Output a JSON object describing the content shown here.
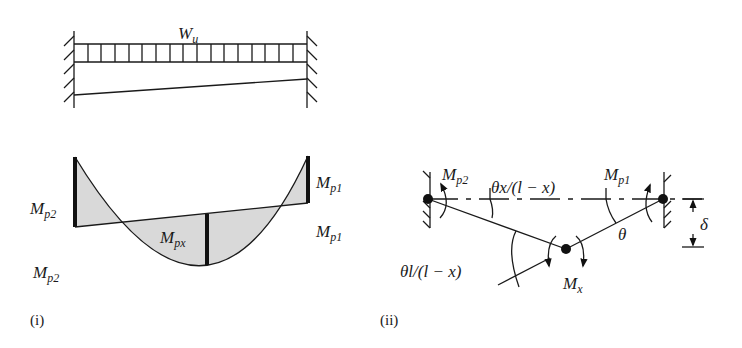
{
  "diagram": {
    "beam": {
      "load_label": "W",
      "load_sub": "u"
    },
    "moment_diagram": {
      "left_top_label": "M",
      "left_top_sub": "p2",
      "left_bottom_label": "M",
      "left_bottom_sub": "p2",
      "right_top_label": "M",
      "right_top_sub": "p1",
      "right_bottom_label": "M",
      "right_bottom_sub": "p1",
      "mid_label": "M",
      "mid_sub": "px",
      "caption": "(i)",
      "fill_color": "#d9d9d9"
    },
    "mechanism": {
      "left_moment_label": "M",
      "left_moment_sub": "p2",
      "right_moment_label": "M",
      "right_moment_sub": "p1",
      "mid_moment_label": "M",
      "mid_moment_sub": "x",
      "left_angle_label": "θx/(l − x)",
      "right_angle_label": "θ",
      "mid_angle_label": "θl/(l − x)",
      "deflection_label": "δ",
      "caption": "(ii)"
    }
  }
}
